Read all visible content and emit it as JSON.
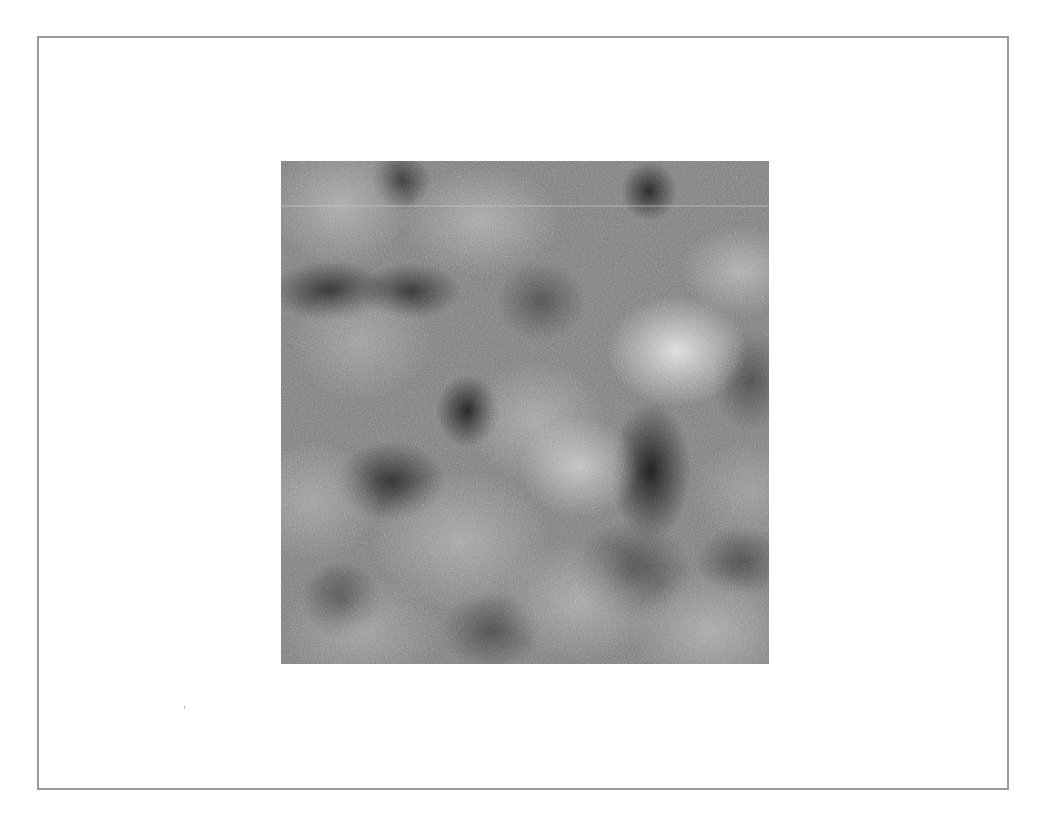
{
  "figure": {
    "frame": {
      "border_color": "#9a9a9a",
      "background": "#ffffff"
    },
    "image": {
      "kind": "grayscale-noise-texture",
      "base_color": "#7c7c7c",
      "highlight_color": "#ebebeb",
      "shadow_color": "#141414"
    }
  }
}
